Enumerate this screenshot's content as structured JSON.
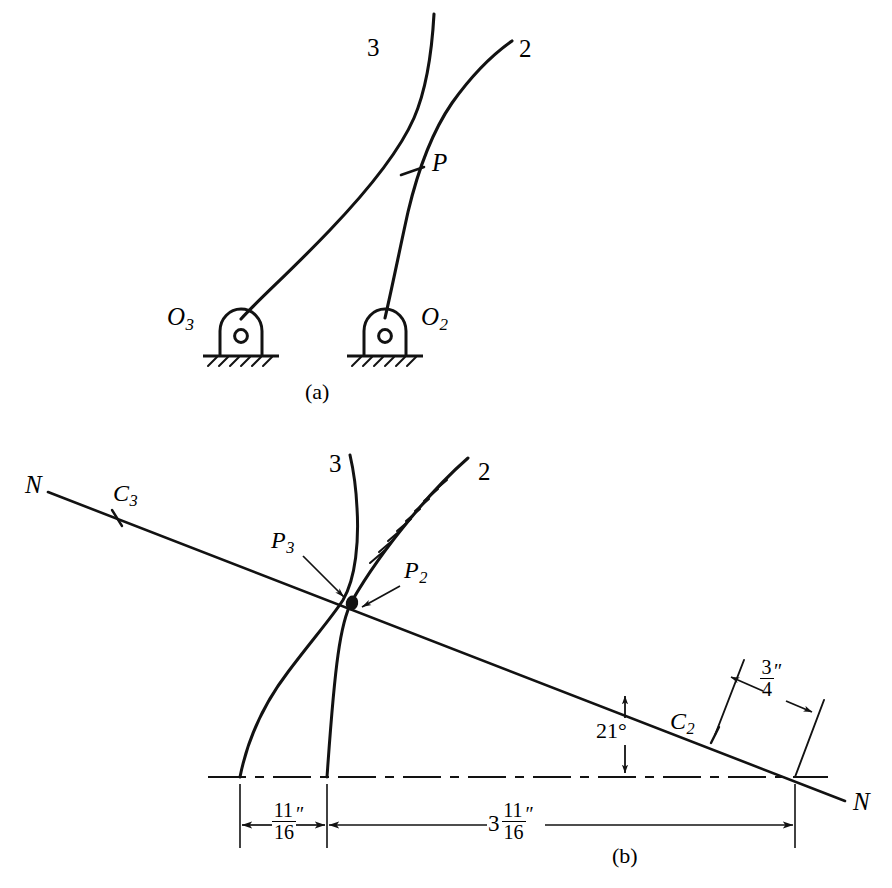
{
  "figure": {
    "type": "engineering-kinematics-diagram",
    "ink_color": "#121212",
    "background_color": "#ffffff",
    "panels": [
      {
        "id": "a",
        "caption": "(a)",
        "description": "Two curved links pivoted to ground meeting at contact point P",
        "labels": {
          "link3": "3",
          "link2": "2",
          "contact_point": "P",
          "pivot_left_base": "O",
          "pivot_left_sub": "3",
          "pivot_right_base": "O",
          "pivot_right_sub": "2"
        }
      },
      {
        "id": "b",
        "caption": "(b)",
        "description": "Velocity / common normal construction with N-N line, centro points and dimensions",
        "labels": {
          "link3": "3",
          "link2": "2",
          "normal_left": "N",
          "normal_right": "N",
          "centro3_base": "C",
          "centro3_sub": "3",
          "centro2_base": "C",
          "centro2_sub": "2",
          "point3_base": "P",
          "point3_sub": "3",
          "point2_base": "P",
          "point2_sub": "2"
        },
        "dimensions": [
          {
            "name": "pivot-spacing",
            "whole": "",
            "numerator": "11",
            "denominator": "16",
            "unit": "″",
            "display": "11/16″"
          },
          {
            "name": "pivot-to-normal-intersection",
            "whole": "3",
            "numerator": "11",
            "denominator": "16",
            "unit": "″",
            "display": "3 11/16″"
          },
          {
            "name": "centro2-offset",
            "whole": "",
            "numerator": "3",
            "denominator": "4",
            "unit": "″",
            "display": "3/4″"
          }
        ],
        "angle": {
          "name": "normal-line-inclination",
          "value": "21",
          "unit": "°",
          "display": "21°"
        }
      }
    ]
  }
}
